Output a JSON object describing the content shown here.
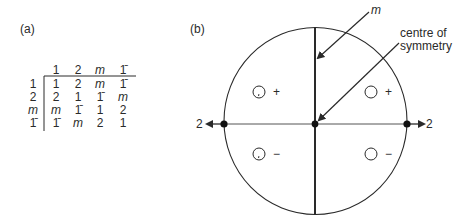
{
  "panel_a": {
    "label": "(a)",
    "table": {
      "column_headers": [
        "1",
        "2",
        "m",
        "1̄"
      ],
      "rows": [
        {
          "header": "1",
          "cells": [
            "1",
            "2",
            "m",
            "1̄"
          ]
        },
        {
          "header": "2",
          "cells": [
            "2",
            "1",
            "1̄",
            "m"
          ]
        },
        {
          "header": "m",
          "cells": [
            "m",
            "1̄",
            "1",
            "2"
          ]
        },
        {
          "header": "1̄",
          "cells": [
            "1̄",
            "m",
            "2",
            "1"
          ]
        }
      ]
    }
  },
  "panel_b": {
    "label": "(b)",
    "labels": {
      "mirror": "m",
      "centre_line1": "centre of",
      "centre_line2": "symmetry",
      "axis_left": "2",
      "axis_right": "2"
    },
    "signs": {
      "top_left": "+",
      "top_right": "+",
      "bottom_left": "−",
      "bottom_right": "−"
    },
    "colors": {
      "line": "#2a2a2a",
      "background": "#ffffff"
    }
  }
}
